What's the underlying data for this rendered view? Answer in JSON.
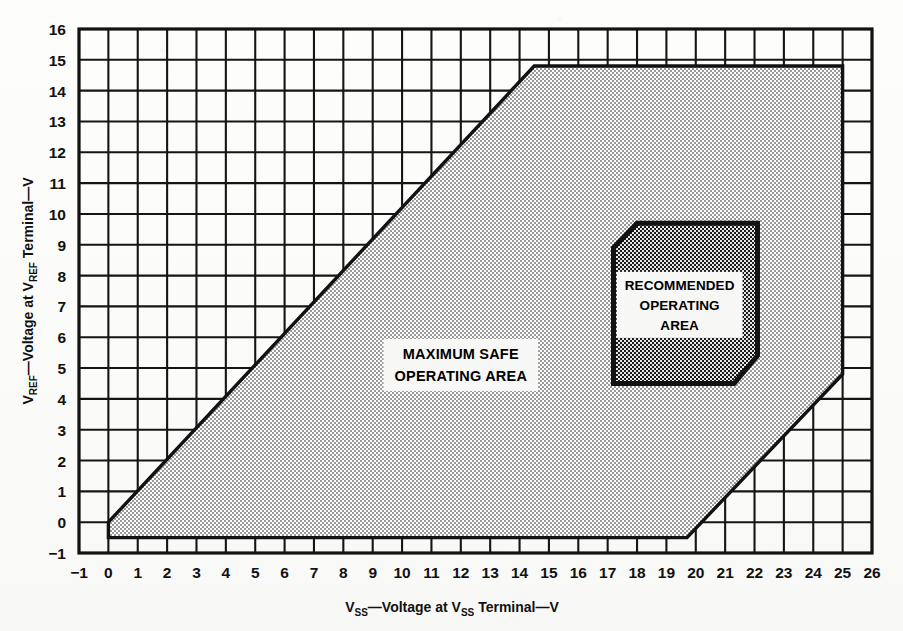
{
  "figure": {
    "background_color": "#fbfbf9",
    "ink_color": "#151515"
  },
  "axes": {
    "x": {
      "label_pre": "V",
      "label_pre_sub": "SS",
      "label_mid": "—Voltage at V",
      "label_mid_sub": "SS",
      "label_post": " Terminal—V",
      "label_full": "VSS—Voltage at VSS Terminal—V",
      "min": -1,
      "max": 26,
      "ticks": [
        "−1",
        "0",
        "1",
        "2",
        "3",
        "4",
        "5",
        "6",
        "7",
        "8",
        "9",
        "10",
        "11",
        "12",
        "13",
        "14",
        "15",
        "16",
        "17",
        "18",
        "19",
        "20",
        "21",
        "22",
        "23",
        "24",
        "25",
        "26"
      ]
    },
    "y": {
      "label_pre": "V",
      "label_pre_sub": "REF",
      "label_mid": "—Voltage at V",
      "label_mid_sub": "REF",
      "label_post": " Terminal—V",
      "label_full": "VREF—Voltage at VREF Terminal—V",
      "min": -1,
      "max": 16,
      "ticks": [
        "−1",
        "0",
        "1",
        "2",
        "3",
        "4",
        "5",
        "6",
        "7",
        "8",
        "9",
        "10",
        "11",
        "12",
        "13",
        "14",
        "15",
        "16"
      ]
    }
  },
  "annotations": {
    "max_safe": {
      "lines": [
        "MAXIMUM SAFE",
        "OPERATING AREA"
      ],
      "x": 12.0,
      "y": 5.1
    },
    "recommended": {
      "lines": [
        "RECOMMENDED",
        "OPERATING",
        "AREA"
      ],
      "x": 19.45,
      "y": 7.05
    }
  },
  "chart_data": {
    "type": "area",
    "title": "",
    "xlabel": "VSS—Voltage at VSS Terminal—V",
    "ylabel": "VREF—Voltage at VREF Terminal—V",
    "xlim": [
      -1,
      26
    ],
    "ylim": [
      -1,
      16
    ],
    "grid": true,
    "legend": "none",
    "regions": [
      {
        "name": "MAXIMUM SAFE OPERATING AREA",
        "fill": "medium-checker",
        "vertices": [
          [
            0.0,
            -0.5
          ],
          [
            0.0,
            0.0
          ],
          [
            14.5,
            14.8
          ],
          [
            25.0,
            14.8
          ],
          [
            25.0,
            4.8
          ],
          [
            19.7,
            -0.5
          ]
        ]
      },
      {
        "name": "RECOMMENDED OPERATING AREA",
        "fill": "dense-checker",
        "vertices": [
          [
            17.2,
            8.9
          ],
          [
            18.0,
            9.7
          ],
          [
            22.1,
            9.7
          ],
          [
            22.1,
            5.4
          ],
          [
            21.3,
            4.5
          ],
          [
            17.2,
            4.5
          ]
        ]
      }
    ]
  }
}
